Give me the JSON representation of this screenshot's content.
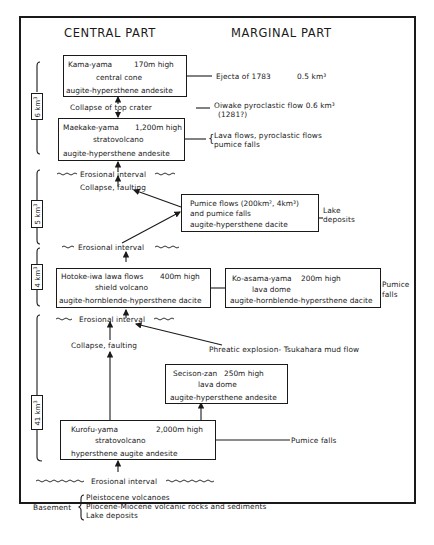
{
  "headers": {
    "central": "CENTRAL PART",
    "marginal": "MARGINAL PART"
  },
  "volumes": [
    {
      "label": "6 km3"
    },
    {
      "label": "5 km3"
    },
    {
      "label": "4 km3"
    },
    {
      "label": "41 km3"
    }
  ],
  "central_boxes": {
    "kama": {
      "name": "Kama-yama",
      "height": "170m high",
      "type": "central cone",
      "rock": "augite-hypersthene andesite"
    },
    "maekake": {
      "name": "Maekake-yama",
      "height": "1,200m high",
      "type": "stratovolcano",
      "rock": "augite-hypersthene andesite"
    },
    "hotoke": {
      "name": "Hotoke-iwa lawa flows",
      "height": "400m high",
      "type": "shield volcano",
      "rock": "augite-hornblende-hypersthene dacite"
    },
    "kurofu": {
      "name": "Kurofu-yama",
      "height": "2,000m high",
      "type": "stratovolcano",
      "rock": "hypersthene augite andesite"
    }
  },
  "marginal_boxes": {
    "pumice": {
      "line1": "Pumice flows (200km², 4km³)",
      "line2": "and pumice falls",
      "rock": "augite-hypersthene dacite"
    },
    "koasama": {
      "name": "Ko-asama-yama",
      "height": "200m high",
      "type": "lava dome",
      "rock": "augite-hornblende-hypersthene dacite"
    },
    "secison": {
      "name": "Secison-zan",
      "height": "250m high",
      "type": "lava dome",
      "rock": "augite-hypersthene andesite"
    }
  },
  "events": {
    "collapse_top": "Collapse of top crater",
    "collapse_faulting_1": "Collapse, faulting",
    "collapse_faulting_2": "Collapse, faulting",
    "erosional_1": "Erosional interval",
    "erosional_2": "Erosional interval",
    "erosional_3": "Erosional interval",
    "erosional_4": "Erosional interval",
    "phreatic": "Phreatic explosion- Tsukahara mud flow"
  },
  "marginal_notes": {
    "ejecta": "Ejecta of 1783",
    "ejecta_vol": "0.5 km³",
    "oiwake_1": "Oiwake pyroclastic flow 0.6 km³",
    "oiwake_2": "(1281?)",
    "lava_1": "Lava flows, pyroclastic flows",
    "lava_2": "pumice falls",
    "lake_1": "Lake",
    "lake_2": "deposits",
    "pumice_falls_1": "Pumice",
    "pumice_falls_2": "falls",
    "pumice_falls_kurofu": "Pumice falls"
  },
  "basement": {
    "label": "Basement",
    "items": [
      "Pleistocene volcanoes",
      "Pliocene-Miocene volcanic rocks and sediments",
      "Lake deposits"
    ]
  }
}
